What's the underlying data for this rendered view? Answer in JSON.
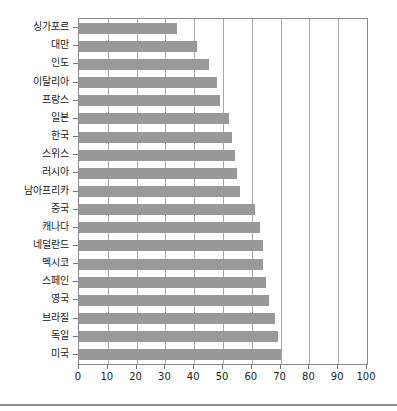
{
  "chart_data": {
    "type": "bar",
    "orientation": "horizontal",
    "title": "",
    "subtitle": "",
    "xlabel": "",
    "ylabel": "",
    "xlim": [
      0,
      100
    ],
    "ylim": null,
    "grid": true,
    "legend": null,
    "legend_position": "none",
    "bar_color": "#999999",
    "axis_color": "#8a8a8a",
    "gridline_color": "#a8a8a8",
    "xticks": [
      0,
      10,
      20,
      30,
      40,
      50,
      60,
      70,
      80,
      90,
      100
    ],
    "xtick_labels": [
      "0",
      "10",
      "20",
      "30",
      "40",
      "50",
      "60",
      "70",
      "80",
      "90",
      "100"
    ],
    "categories": [
      "싱가포르",
      "대만",
      "인도",
      "이탈리아",
      "프랑스",
      "일본",
      "한국",
      "스위스",
      "러시아",
      "남아프리카",
      "중국",
      "캐나다",
      "네덜란드",
      "멕시코",
      "스페인",
      "영국",
      "브라질",
      "독일",
      "미국"
    ],
    "values": [
      34,
      41,
      45,
      48,
      49,
      52,
      53,
      54,
      55,
      56,
      61,
      63,
      64,
      64,
      65,
      66,
      68,
      69,
      70
    ]
  }
}
